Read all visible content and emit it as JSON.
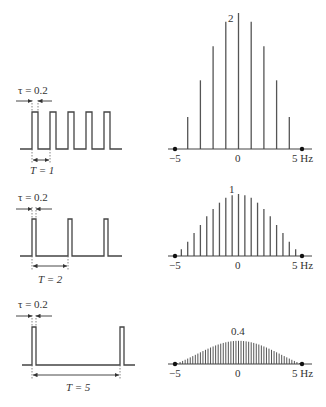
{
  "panels": [
    {
      "id": "T1",
      "tau_label": "τ = 0.2",
      "period_label": "T = 1",
      "peak_label": "2",
      "axis_left": "−5",
      "axis_center": "0",
      "axis_right": "5 Hz"
    },
    {
      "id": "T2",
      "tau_label": "τ = 0.2",
      "period_label": "T = 2",
      "peak_label": "1",
      "axis_left": "−5",
      "axis_center": "0",
      "axis_right": "5 Hz"
    },
    {
      "id": "T5",
      "tau_label": "τ = 0.2",
      "period_label": "T = 5",
      "peak_label": "0.4",
      "axis_left": "−5",
      "axis_center": "0",
      "axis_right": "5 Hz"
    }
  ],
  "chart_data": [
    {
      "type": "bar",
      "title": "Line spectrum of pulse train, τ = 0.2, T = 1",
      "xlabel": "Hz",
      "x": [
        -4,
        -3,
        -2,
        -1,
        0,
        1,
        2,
        3,
        4
      ],
      "values": [
        0.47,
        1.01,
        1.51,
        1.87,
        2.0,
        1.87,
        1.51,
        1.01,
        0.47
      ],
      "xlim": [
        -5,
        5
      ],
      "peak_label": "2"
    },
    {
      "type": "bar",
      "title": "Line spectrum of pulse train, τ = 0.2, T = 2",
      "xlabel": "Hz",
      "x": [
        -4.5,
        -4,
        -3.5,
        -3,
        -2.5,
        -2,
        -1.5,
        -1,
        -0.5,
        0,
        0.5,
        1,
        1.5,
        2,
        2.5,
        3,
        3.5,
        4,
        4.5
      ],
      "values": [
        0.11,
        0.23,
        0.37,
        0.5,
        0.64,
        0.76,
        0.86,
        0.94,
        0.98,
        1.0,
        0.98,
        0.94,
        0.86,
        0.76,
        0.64,
        0.5,
        0.37,
        0.23,
        0.11
      ],
      "xlim": [
        -5,
        5
      ],
      "peak_label": "1"
    },
    {
      "type": "bar",
      "title": "Line spectrum of pulse train, τ = 0.2, T = 5",
      "xlabel": "Hz",
      "x_spacing": 0.2,
      "envelope": "0.4·sinc(0.2 f)",
      "xlim": [
        -5,
        5
      ],
      "peak_value": 0.4,
      "peak_label": "0.4"
    }
  ]
}
